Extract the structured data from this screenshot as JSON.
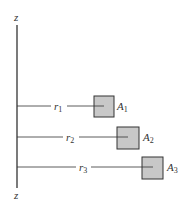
{
  "diagram": {
    "axis": {
      "top_label": "z",
      "bottom_label": "z"
    },
    "areas": [
      {
        "radius_label": "r",
        "radius_sub": "1",
        "area_label": "A",
        "area_sub": "1"
      },
      {
        "radius_label": "r",
        "radius_sub": "2",
        "area_label": "A",
        "area_sub": "2"
      },
      {
        "radius_label": "r",
        "radius_sub": "3",
        "area_label": "A",
        "area_sub": "3"
      }
    ],
    "colors": {
      "square_fill": "#c8c8c8",
      "line": "#333333"
    }
  }
}
